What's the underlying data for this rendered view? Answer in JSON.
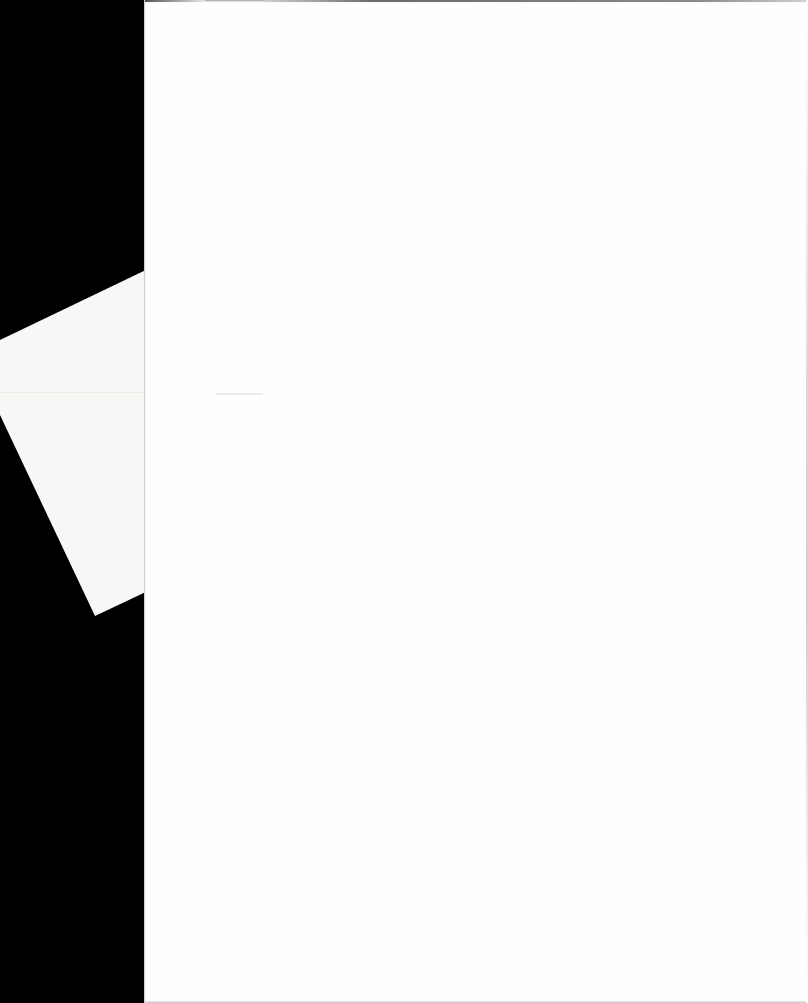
{
  "scene": {
    "description_colors": {
      "background": "#000000",
      "front_sheet": "#fefefe",
      "back_sheet": "#f7f7f5"
    },
    "sheets": [
      {
        "id": "back",
        "text": ""
      },
      {
        "id": "front",
        "text": ""
      }
    ]
  }
}
